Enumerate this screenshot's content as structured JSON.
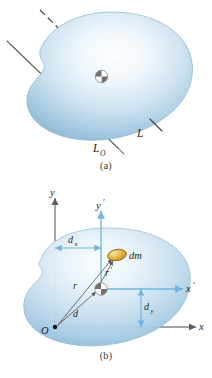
{
  "figure": {
    "panels": [
      {
        "id": "a",
        "caption": "(a)",
        "labels": {
          "axis_through_cm": "L",
          "axis_through_o": "L",
          "axis_through_o_sub": "O"
        },
        "elements": [
          "irregular-body",
          "center-of-mass-marker",
          "axis-L-dashed",
          "axis-LO-solid"
        ]
      },
      {
        "id": "b",
        "caption": "(b)",
        "labels": {
          "y_axis": "y",
          "x_axis": "x",
          "y_prime_axis": "y",
          "y_prime_axis_prime": "′",
          "x_prime_axis": "x",
          "x_prime_axis_prime": "′",
          "origin": "O",
          "mass_element": "dm",
          "r_from_origin": "r",
          "r_prime_from_cm": "r",
          "r_prime_mark": "′",
          "d_distance": "d",
          "dx_distance": "d",
          "dx_sub": "x",
          "dy_distance": "d",
          "dy_sub": "y"
        },
        "elements": [
          "irregular-body",
          "center-of-mass-marker",
          "mass-element-dm",
          "origin-dot",
          "vector-r",
          "vector-r-prime",
          "vector-d",
          "dimension-dx",
          "dimension-dy"
        ]
      }
    ]
  },
  "colors": {
    "body_fill_light": "#f2f7fb",
    "body_fill_mid": "#bed8ea",
    "body_fill_dark": "#8ebcd8",
    "body_edge": "#7fb0cf",
    "axis_gray": "#6e6e6e",
    "axis_blue": "#6fb4dd",
    "dm_fill": "#e3b43c",
    "dm_edge": "#8a6a14",
    "text": "#1d1d1d",
    "line_dark": "#4a4a4a"
  }
}
